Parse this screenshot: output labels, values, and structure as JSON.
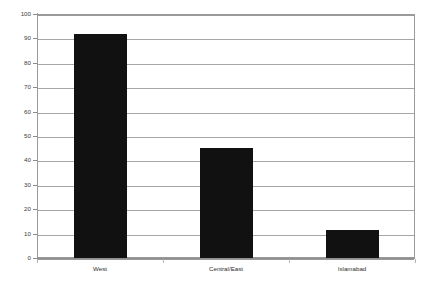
{
  "chart_data": {
    "type": "bar",
    "title": "",
    "subtitle": "",
    "xlabel": "",
    "ylabel": "",
    "categories": [
      "West",
      "Central/East",
      "Islamabad"
    ],
    "values": [
      92,
      45,
      11.5
    ],
    "series": [
      {
        "name": "",
        "values": [
          92,
          45,
          11.5
        ]
      }
    ],
    "ylim": [
      0,
      100
    ],
    "y_ticks": [
      0,
      10,
      20,
      30,
      40,
      50,
      60,
      70,
      80,
      90,
      100
    ],
    "y_tick_labels": [
      "0",
      "10",
      "20",
      "30",
      "40",
      "50",
      "60",
      "70",
      "80",
      "90",
      "100"
    ],
    "grid": true,
    "grid_axis": "y",
    "legend": false,
    "legend_position": "none",
    "bar_color": "#111111",
    "gridline_color": "#a6a6a6",
    "axis_color": "#9a9a9a",
    "background_color": "#ffffff",
    "annotations": []
  }
}
